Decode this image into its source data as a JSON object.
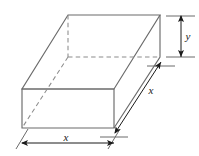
{
  "figure": {
    "stroke_color": "#6b6b6b",
    "hidden_stroke_color": "#8c8c8c",
    "arrow_color": "#1a1a1a",
    "background_color": "#ffffff",
    "solid": {
      "name": "rectangular box",
      "vertices": {
        "top_back_left": [
          68,
          15
        ],
        "top_back_right": [
          160,
          15
        ],
        "top_front_right": [
          114,
          89
        ],
        "top_front_left": [
          22,
          89
        ],
        "bottom_front_left": [
          22,
          128
        ],
        "bottom_front_right": [
          114,
          128
        ],
        "bottom_back_right": [
          160,
          57
        ],
        "bottom_back_left": [
          68,
          57
        ]
      },
      "hidden_edges": [
        "top_back_left-bottom_back_left",
        "bottom_back_left-bottom_back_right",
        "bottom_back_left-bottom_front_left"
      ]
    },
    "dimensions": [
      {
        "id": "width",
        "label": "x",
        "orientation": "horizontal",
        "position": "bottom",
        "label_x": 66,
        "label_y": 141,
        "from": [
          22,
          143
        ],
        "to": [
          114,
          143
        ]
      },
      {
        "id": "depth",
        "label": "x",
        "orientation": "diagonal",
        "position": "right",
        "label_x": 151,
        "label_y": 93,
        "from": [
          115,
          133
        ],
        "to": [
          161,
          62
        ]
      },
      {
        "id": "height",
        "label": "y",
        "orientation": "vertical",
        "position": "right",
        "label_x": 186,
        "label_y": 40,
        "from": [
          181,
          16
        ],
        "to": [
          181,
          57
        ]
      }
    ]
  }
}
